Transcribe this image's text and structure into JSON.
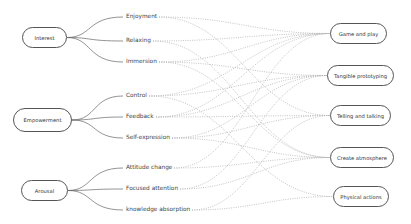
{
  "diagram": {
    "type": "mapping",
    "categories": [
      {
        "id": "interest",
        "label": "Interest",
        "box": [
          22,
          27,
          45,
          21
        ],
        "items": [
          {
            "id": "enjoyment",
            "label": "Enjoyment",
            "y": 17
          },
          {
            "id": "relaxing",
            "label": "Relaxing",
            "y": 41
          },
          {
            "id": "immersion",
            "label": "Immersion",
            "y": 62
          }
        ]
      },
      {
        "id": "empowerment",
        "label": "Empowerment",
        "box": [
          13,
          108,
          59,
          24
        ],
        "items": [
          {
            "id": "control",
            "label": "Control",
            "y": 96
          },
          {
            "id": "feedback",
            "label": "Feedback",
            "y": 117
          },
          {
            "id": "self-expression",
            "label": "Self-expression",
            "y": 138
          }
        ]
      },
      {
        "id": "arousal",
        "label": "Arousal",
        "box": [
          21,
          180,
          47,
          21
        ],
        "items": [
          {
            "id": "attitude-change",
            "label": "Attitude change",
            "y": 168
          },
          {
            "id": "focused-attention",
            "label": "Focused attention",
            "y": 189
          },
          {
            "id": "knowledge-absorption",
            "label": "knowledge absorption",
            "y": 210
          }
        ]
      }
    ],
    "item_x": 126,
    "targets": [
      {
        "id": "game-and-play",
        "label": "Game and play",
        "box": [
          330,
          23,
          57,
          21
        ]
      },
      {
        "id": "tangible-prototyping",
        "label": "Tangible prototyping",
        "box": [
          327,
          65,
          67,
          21
        ]
      },
      {
        "id": "telling-and-talking",
        "label": "Telling and talking",
        "box": [
          330,
          105,
          61,
          21
        ]
      },
      {
        "id": "create-atmosphere",
        "label": "Create atmosphere",
        "box": [
          330,
          147,
          64,
          21
        ]
      },
      {
        "id": "physical-actions",
        "label": "Physical actions",
        "box": [
          333,
          186,
          56,
          21
        ]
      }
    ],
    "connections": [
      [
        "enjoyment",
        "game-and-play"
      ],
      [
        "enjoyment",
        "telling-and-talking"
      ],
      [
        "relaxing",
        "game-and-play"
      ],
      [
        "relaxing",
        "create-atmosphere"
      ],
      [
        "immersion",
        "game-and-play"
      ],
      [
        "immersion",
        "tangible-prototyping"
      ],
      [
        "immersion",
        "create-atmosphere"
      ],
      [
        "control",
        "game-and-play"
      ],
      [
        "control",
        "tangible-prototyping"
      ],
      [
        "control",
        "physical-actions"
      ],
      [
        "feedback",
        "game-and-play"
      ],
      [
        "feedback",
        "tangible-prototyping"
      ],
      [
        "feedback",
        "telling-and-talking"
      ],
      [
        "self-expression",
        "tangible-prototyping"
      ],
      [
        "self-expression",
        "telling-and-talking"
      ],
      [
        "self-expression",
        "create-atmosphere"
      ],
      [
        "attitude-change",
        "game-and-play"
      ],
      [
        "attitude-change",
        "create-atmosphere"
      ],
      [
        "focused-attention",
        "tangible-prototyping"
      ],
      [
        "focused-attention",
        "create-atmosphere"
      ],
      [
        "knowledge-absorption",
        "telling-and-talking"
      ],
      [
        "knowledge-absorption",
        "physical-actions"
      ]
    ],
    "colors": {
      "box_border": "#555555",
      "branch_line": "#666666",
      "dotted_line": "#b5b5b5",
      "text": "#333333"
    }
  }
}
